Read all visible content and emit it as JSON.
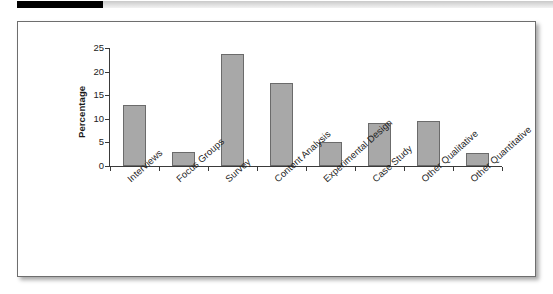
{
  "header": {
    "black_bar_color": "#000000",
    "gray_bar_color": "#d4d4d4"
  },
  "figure": {
    "border_color": "#6e6e6e",
    "background_color": "#ffffff"
  },
  "chart_data": {
    "type": "bar",
    "title": "",
    "xlabel": "",
    "ylabel": "Percentage",
    "categories": [
      "Interviews",
      "Focus Groups",
      "Survey",
      "Content Analysis",
      "Experimental Design",
      "Case Study",
      "Other Qualitative",
      "Other Quantitative"
    ],
    "values": [
      13.0,
      2.9,
      23.8,
      17.5,
      5.0,
      9.2,
      9.6,
      2.8
    ],
    "ylim": [
      0,
      25
    ],
    "yticks": [
      0,
      5,
      10,
      15,
      20,
      25
    ],
    "ytick_labels": [
      "0",
      "5",
      "10",
      "15",
      "20",
      "25"
    ],
    "grid": false,
    "legend": false,
    "bar_fill_color": "#a8a8a8",
    "bar_edge_color": "#6b6b6b",
    "axis_color": "#3a3a3a",
    "xtick_label_rotation": -42
  }
}
